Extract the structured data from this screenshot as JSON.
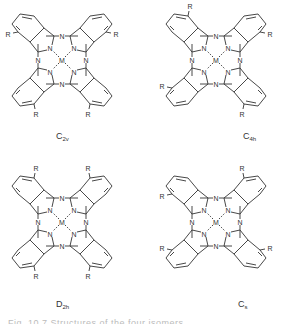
{
  "figure": {
    "atoms": {
      "center": "M",
      "nitrogen": "N",
      "substituent": "R"
    },
    "line_color": "#333333",
    "isomers": [
      {
        "id": "c2v",
        "label_main": "C",
        "label_sub": "2v",
        "r_positions": {
          "tl": "left",
          "tr": "right",
          "bl": "bottom",
          "br": "bottom"
        }
      },
      {
        "id": "c4h",
        "label_main": "C",
        "label_sub": "4h",
        "r_positions": {
          "tl": "top",
          "tr": "right",
          "bl": "left",
          "br": "bottom"
        }
      },
      {
        "id": "d2h",
        "label_main": "D",
        "label_sub": "2h",
        "r_positions": {
          "tl": "top",
          "tr": "top",
          "bl": "bottom",
          "br": "bottom"
        }
      },
      {
        "id": "cs",
        "label_main": "C",
        "label_sub": "s",
        "r_positions": {
          "tl": "left",
          "tr": "top",
          "bl": "left",
          "br": "right"
        }
      }
    ],
    "caption_clipped": "Fig. 10.7   Structures of the four isomers..."
  }
}
